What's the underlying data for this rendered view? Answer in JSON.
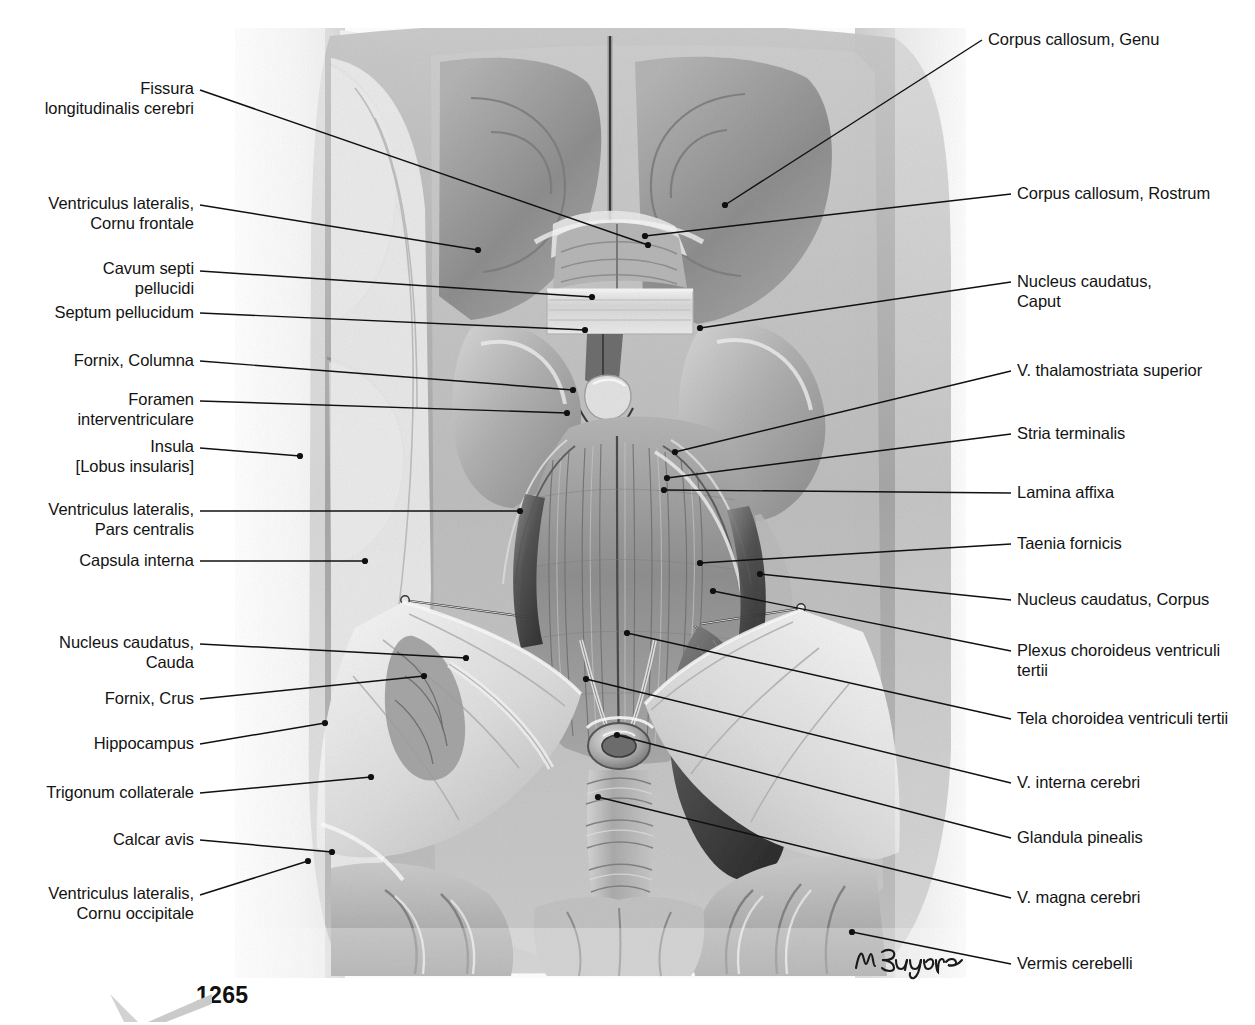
{
  "plate": {
    "page_number": "1265",
    "signature": "M. Brugger",
    "illustration_title": "Horizontal dissection of the cerebrum exposing the lateral and third ventricles"
  },
  "labels_left": [
    {
      "id": "fissura-longitudinalis-cerebri",
      "text": "Fissura\nlongitudinalis cerebri",
      "x": 8,
      "y": 79,
      "w": 186,
      "lines": 2,
      "leader": {
        "x1": 200,
        "y1": 90,
        "x2": 648,
        "y2": 245
      }
    },
    {
      "id": "ventriculus-lateralis-cornu-frontale",
      "text": "Ventriculus lateralis,\nCornu frontale",
      "x": 8,
      "y": 194,
      "w": 186,
      "lines": 2,
      "leader": {
        "x1": 200,
        "y1": 205,
        "x2": 478,
        "y2": 250
      }
    },
    {
      "id": "cavum-septi-pellucidi",
      "text": "Cavum septi\npellucidi",
      "x": 8,
      "y": 259,
      "w": 186,
      "lines": 2,
      "leader": {
        "x1": 200,
        "y1": 271,
        "x2": 592,
        "y2": 297
      }
    },
    {
      "id": "septum-pellucidum",
      "text": "Septum pellucidum",
      "x": 8,
      "y": 303,
      "w": 186,
      "lines": 1,
      "leader": {
        "x1": 200,
        "y1": 313,
        "x2": 585,
        "y2": 330
      }
    },
    {
      "id": "fornix-columna",
      "text": "Fornix, Columna",
      "x": 8,
      "y": 351,
      "w": 186,
      "lines": 1,
      "leader": {
        "x1": 200,
        "y1": 361,
        "x2": 573,
        "y2": 390
      }
    },
    {
      "id": "foramen-interventriculare",
      "text": "Foramen\ninterventriculare",
      "x": 8,
      "y": 390,
      "w": 186,
      "lines": 2,
      "leader": {
        "x1": 200,
        "y1": 401,
        "x2": 567,
        "y2": 413
      }
    },
    {
      "id": "insula-lobus-insularis",
      "text": "Insula\n[Lobus insularis]",
      "x": 8,
      "y": 437,
      "w": 186,
      "lines": 2,
      "leader": {
        "x1": 200,
        "y1": 448,
        "x2": 300,
        "y2": 456
      }
    },
    {
      "id": "ventriculus-lateralis-pars-centralis",
      "text": "Ventriculus lateralis,\nPars centralis",
      "x": 8,
      "y": 500,
      "w": 186,
      "lines": 2,
      "leader": {
        "x1": 200,
        "y1": 511,
        "x2": 520,
        "y2": 511
      }
    },
    {
      "id": "capsula-interna",
      "text": "Capsula interna",
      "x": 8,
      "y": 551,
      "w": 186,
      "lines": 1,
      "leader": {
        "x1": 200,
        "y1": 561,
        "x2": 365,
        "y2": 561
      }
    },
    {
      "id": "nucleus-caudatus-cauda",
      "text": "Nucleus caudatus,\nCauda",
      "x": 8,
      "y": 633,
      "w": 186,
      "lines": 2,
      "leader": {
        "x1": 200,
        "y1": 644,
        "x2": 466,
        "y2": 658
      }
    },
    {
      "id": "fornix-crus",
      "text": "Fornix, Crus",
      "x": 8,
      "y": 689,
      "w": 186,
      "lines": 1,
      "leader": {
        "x1": 200,
        "y1": 699,
        "x2": 424,
        "y2": 676
      }
    },
    {
      "id": "hippocampus",
      "text": "Hippocampus",
      "x": 8,
      "y": 734,
      "w": 186,
      "lines": 1,
      "leader": {
        "x1": 200,
        "y1": 744,
        "x2": 325,
        "y2": 723
      }
    },
    {
      "id": "trigonum-collaterale",
      "text": "Trigonum collaterale",
      "x": 8,
      "y": 783,
      "w": 186,
      "lines": 1,
      "leader": {
        "x1": 200,
        "y1": 793,
        "x2": 371,
        "y2": 777
      }
    },
    {
      "id": "calcar-avis",
      "text": "Calcar avis",
      "x": 8,
      "y": 830,
      "w": 186,
      "lines": 1,
      "leader": {
        "x1": 200,
        "y1": 840,
        "x2": 332,
        "y2": 852
      }
    },
    {
      "id": "ventriculus-lateralis-cornu-occipitale",
      "text": "Ventriculus lateralis,\nCornu occipitale",
      "x": 8,
      "y": 884,
      "w": 186,
      "lines": 2,
      "leader": {
        "x1": 200,
        "y1": 895,
        "x2": 308,
        "y2": 861
      }
    }
  ],
  "labels_right": [
    {
      "id": "corpus-callosum-genu",
      "text": "Corpus callosum, Genu",
      "x": 988,
      "y": 30,
      "leader": {
        "x1": 982,
        "y1": 40,
        "x2": 725,
        "y2": 205
      }
    },
    {
      "id": "corpus-callosum-rostrum",
      "text": "Corpus callosum, Rostrum",
      "x": 1017,
      "y": 184,
      "leader": {
        "x1": 1011,
        "y1": 194,
        "x2": 645,
        "y2": 236
      }
    },
    {
      "id": "nucleus-caudatus-caput",
      "text": "Nucleus caudatus,\nCaput",
      "x": 1017,
      "y": 272,
      "leader": {
        "x1": 1011,
        "y1": 282,
        "x2": 700,
        "y2": 328
      }
    },
    {
      "id": "v-thalamostriata-superior",
      "text": "V. thalamostriata superior",
      "x": 1017,
      "y": 361,
      "leader": {
        "x1": 1011,
        "y1": 371,
        "x2": 675,
        "y2": 452
      }
    },
    {
      "id": "stria-terminalis",
      "text": "Stria terminalis",
      "x": 1017,
      "y": 424,
      "leader": {
        "x1": 1011,
        "y1": 434,
        "x2": 667,
        "y2": 478
      }
    },
    {
      "id": "lamina-affixa",
      "text": "Lamina affixa",
      "x": 1017,
      "y": 483,
      "leader": {
        "x1": 1011,
        "y1": 493,
        "x2": 664,
        "y2": 490
      }
    },
    {
      "id": "taenia-fornicis",
      "text": "Taenia fornicis",
      "x": 1017,
      "y": 534,
      "leader": {
        "x1": 1011,
        "y1": 544,
        "x2": 700,
        "y2": 563
      }
    },
    {
      "id": "nucleus-caudatus-corpus",
      "text": "Nucleus caudatus, Corpus",
      "x": 1017,
      "y": 590,
      "leader": {
        "x1": 1011,
        "y1": 600,
        "x2": 760,
        "y2": 574
      }
    },
    {
      "id": "plexus-choroideus-ventriculi-tertii",
      "text": "Plexus choroideus ventriculi\ntertii",
      "x": 1017,
      "y": 641,
      "leader": {
        "x1": 1011,
        "y1": 651,
        "x2": 713,
        "y2": 591
      }
    },
    {
      "id": "tela-choroidea-ventriculi-tertii",
      "text": "Tela choroidea ventriculi tertii",
      "x": 1017,
      "y": 709,
      "leader": {
        "x1": 1011,
        "y1": 719,
        "x2": 627,
        "y2": 633
      }
    },
    {
      "id": "v-interna-cerebri",
      "text": "V. interna cerebri",
      "x": 1017,
      "y": 773,
      "leader": {
        "x1": 1011,
        "y1": 783,
        "x2": 586,
        "y2": 679
      }
    },
    {
      "id": "glandula-pinealis",
      "text": "Glandula pinealis",
      "x": 1017,
      "y": 828,
      "leader": {
        "x1": 1011,
        "y1": 838,
        "x2": 617,
        "y2": 735
      }
    },
    {
      "id": "v-magna-cerebri",
      "text": "V. magna cerebri",
      "x": 1017,
      "y": 888,
      "leader": {
        "x1": 1011,
        "y1": 898,
        "x2": 598,
        "y2": 797
      }
    },
    {
      "id": "vermis-cerebelli",
      "text": "Vermis cerebelli",
      "x": 1017,
      "y": 954,
      "leader": {
        "x1": 1011,
        "y1": 964,
        "x2": 852,
        "y2": 932
      }
    }
  ],
  "colors": {
    "text": "#131313",
    "leader_line": "#101010",
    "background": "#ffffff",
    "illustration_mid": "#9b9b9b",
    "illustration_dark": "#4a4a4a",
    "illustration_light": "#e4e4e4"
  }
}
